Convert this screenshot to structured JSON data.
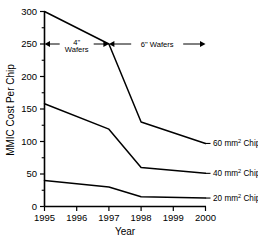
{
  "chart_data": {
    "type": "line",
    "title": "",
    "xlabel": "Year",
    "ylabel": "MMIC Cost Per Chip",
    "x": [
      1995,
      1996,
      1997,
      1998,
      1999,
      2000
    ],
    "xtick_labels": [
      "1995",
      "1996",
      "1997",
      "1998",
      "1999",
      "2000"
    ],
    "ytick_labels": [
      "0",
      "50",
      "100",
      "150",
      "200",
      "250",
      "300"
    ],
    "ytick_values": [
      0,
      50,
      100,
      150,
      200,
      250,
      300
    ],
    "yminor_values": [
      25,
      75,
      125,
      175,
      225,
      275
    ],
    "xlim": [
      1995,
      2000
    ],
    "ylim": [
      0,
      300
    ],
    "grid": false,
    "legend_position": "right-inline",
    "series": [
      {
        "name": "60 mm2 Chip",
        "label_text": "60 mm",
        "label_sup": "2",
        "label_tail": " Chip",
        "x": [
          1995,
          1997,
          1998,
          2000
        ],
        "values": [
          300,
          250,
          130,
          97
        ]
      },
      {
        "name": "40 mm2 Chip",
        "label_text": "40 mm",
        "label_sup": "2",
        "label_tail": " Chip",
        "x": [
          1995,
          1997,
          1998,
          2000
        ],
        "values": [
          158,
          119,
          60,
          51
        ]
      },
      {
        "name": "20 mm2 Chip",
        "label_text": "20 mm",
        "label_sup": "2",
        "label_tail": " Chip",
        "x": [
          1995,
          1997,
          1998,
          2000
        ],
        "values": [
          40,
          30,
          15,
          13
        ]
      }
    ],
    "annotations": [
      {
        "id": "four-inch-wafers",
        "line1": "4\"",
        "line2": "Wafers",
        "x_start": 1995,
        "x_end": 1997,
        "y": 250
      },
      {
        "id": "six-inch-wafers",
        "line1": "6\" Wafers",
        "line2": "",
        "x_start": 1997,
        "x_end": 2000,
        "y": 250
      }
    ]
  }
}
